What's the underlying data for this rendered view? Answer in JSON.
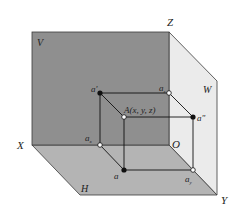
{
  "diagram": {
    "colors": {
      "v_plane": "#8f8f8f",
      "h_plane": "#b4b4b4",
      "w_plane": "#ebebeb",
      "edge": "#3a3a3a",
      "line": "#111111",
      "background": "#ffffff"
    },
    "planes": {
      "v": "V",
      "h": "H",
      "w": "W"
    },
    "axes": {
      "x": "X",
      "y": "Y",
      "z": "Z",
      "origin": "O"
    },
    "points": {
      "a_prime": {
        "label": "a'",
        "type": "filled"
      },
      "a_double_prime": {
        "label": "a\"",
        "type": "filled"
      },
      "a": {
        "label": "a",
        "type": "filled"
      },
      "A": {
        "label": "A(x, y, z)",
        "type": "open"
      },
      "a_x": {
        "label": "a",
        "sub": "x",
        "type": "open"
      },
      "a_y": {
        "label": "a",
        "sub": "y",
        "type": "open"
      },
      "a_z": {
        "label": "a",
        "sub": "z",
        "type": "open"
      }
    }
  }
}
